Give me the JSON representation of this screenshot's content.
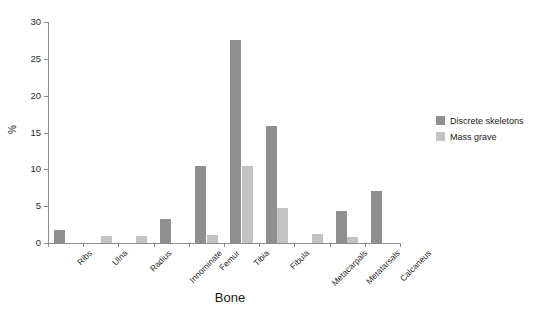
{
  "chart_data": {
    "type": "bar",
    "title": "",
    "xlabel": "Bone",
    "ylabel": "%",
    "ylim": [
      0,
      30
    ],
    "yticks": [
      0,
      5,
      10,
      15,
      20,
      25,
      30
    ],
    "grid": false,
    "legend_position": "right",
    "categories": [
      "Ribs",
      "Ulna",
      "Radius",
      "Innominate",
      "Femur",
      "Tibia",
      "Fibula",
      "Metacarpals",
      "Metatarsals",
      "Calcaneus"
    ],
    "series": [
      {
        "name": "Discrete skeletons",
        "color": "#8f8f8f",
        "values": [
          1.7,
          0,
          0,
          3.3,
          10.4,
          27.5,
          15.9,
          0,
          4.3,
          7.1
        ]
      },
      {
        "name": "Mass grave",
        "color": "#c2c2c2",
        "values": [
          0,
          0.9,
          0.9,
          0,
          1.1,
          10.5,
          4.7,
          1.2,
          0.8,
          0
        ]
      }
    ]
  },
  "axis": {
    "y_title": "%",
    "x_title": "Bone"
  },
  "colors": {
    "series_discrete": "#8f8f8f",
    "series_mass_grave": "#c2c2c2",
    "axis": "#8d8d8d",
    "background": "#ffffff"
  }
}
